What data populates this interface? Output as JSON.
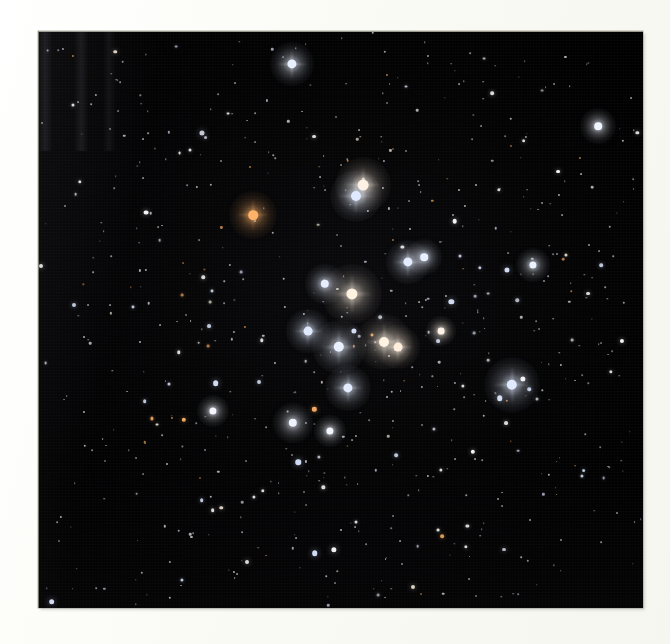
{
  "page": {
    "background_color": "#fbfbf7",
    "kind": "printed-photograph-plate"
  },
  "photo": {
    "alt_title": "Open star cluster astrophotograph",
    "frame": {
      "x": 38,
      "y": 31,
      "width": 605,
      "height": 577
    },
    "sky_background_color": "#000000",
    "border_color": "#cdcbba"
  },
  "chart_data": {
    "type": "scatter",
    "xlabel": "",
    "ylabel": "",
    "xlim": [
      0,
      605
    ],
    "ylim": [
      0,
      577
    ],
    "grid": false,
    "legend": null,
    "note": "Positions are pixel coordinates inside the photographic plate; size encodes apparent brightness (magnitude proxy), color encodes stellar color index.",
    "star_colors": {
      "blue_white": "#dce8ff",
      "white": "#ffffff",
      "warm_white": "#fff3e2",
      "amber": "#ffc98a",
      "orange": "#ffb267",
      "faint_grey": "#cfd4e0"
    },
    "bright_stars": [
      {
        "x": 254,
        "y": 33,
        "r": 4.6,
        "color": "#e8f0ff",
        "glow": 22
      },
      {
        "x": 325,
        "y": 154,
        "r": 5.4,
        "color": "#fff0dd",
        "glow": 28
      },
      {
        "x": 318,
        "y": 165,
        "r": 5.0,
        "color": "#dfe9ff",
        "glow": 26
      },
      {
        "x": 215,
        "y": 184,
        "r": 4.8,
        "color": "#ffb267",
        "glow": 24
      },
      {
        "x": 370,
        "y": 231,
        "r": 4.6,
        "color": "#e3ecff",
        "glow": 22
      },
      {
        "x": 287,
        "y": 253,
        "r": 4.2,
        "color": "#e6eeff",
        "glow": 20
      },
      {
        "x": 314,
        "y": 263,
        "r": 5.6,
        "color": "#fff2e0",
        "glow": 30
      },
      {
        "x": 270,
        "y": 300,
        "r": 4.4,
        "color": "#e0eaff",
        "glow": 22
      },
      {
        "x": 301,
        "y": 316,
        "r": 5.2,
        "color": "#e9f1ff",
        "glow": 27
      },
      {
        "x": 346,
        "y": 311,
        "r": 5.0,
        "color": "#fff1df",
        "glow": 28
      },
      {
        "x": 360,
        "y": 316,
        "r": 4.4,
        "color": "#ffeedb",
        "glow": 22
      },
      {
        "x": 310,
        "y": 357,
        "r": 4.6,
        "color": "#e4edff",
        "glow": 23
      },
      {
        "x": 255,
        "y": 392,
        "r": 4.2,
        "color": "#eef3ff",
        "glow": 20
      },
      {
        "x": 292,
        "y": 400,
        "r": 3.6,
        "color": "#f2f6ff",
        "glow": 16
      },
      {
        "x": 386,
        "y": 226,
        "r": 3.8,
        "color": "#e7efff",
        "glow": 18
      },
      {
        "x": 474,
        "y": 354,
        "r": 5.2,
        "color": "#dfeaff",
        "glow": 28
      },
      {
        "x": 495,
        "y": 234,
        "r": 3.6,
        "color": "#eaf1ff",
        "glow": 17
      },
      {
        "x": 560,
        "y": 95,
        "r": 3.8,
        "color": "#f0f4ff",
        "glow": 18
      },
      {
        "x": 403,
        "y": 300,
        "r": 3.4,
        "color": "#fff4e8",
        "glow": 15
      },
      {
        "x": 175,
        "y": 380,
        "r": 3.6,
        "color": "#f3f6ff",
        "glow": 16
      }
    ],
    "counts": {
      "bright_stars": 20,
      "field_stars_approx": 640
    }
  },
  "labels": {
    "none_visible": ""
  }
}
